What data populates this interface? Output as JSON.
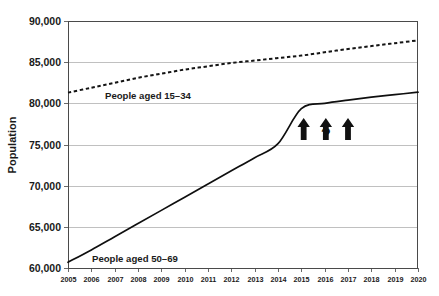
{
  "chart_data": {
    "type": "line",
    "title": "",
    "xlabel": "",
    "ylabel": "Population",
    "xlim": [
      2005,
      2020
    ],
    "ylim": [
      60000,
      90000
    ],
    "grid": true,
    "legend_position": "inline-annotation",
    "x": [
      2005,
      2006,
      2007,
      2008,
      2009,
      2010,
      2011,
      2012,
      2013,
      2014,
      2015,
      2016,
      2017,
      2018,
      2019,
      2020
    ],
    "x_tick_labels": [
      "2005",
      "2006",
      "2007",
      "2008",
      "2009",
      "2010",
      "2011",
      "2012",
      "2013",
      "2014",
      "2015",
      "2016",
      "2017",
      "2018",
      "2019",
      "2020"
    ],
    "y_tick_labels": [
      "60,000",
      "65,000",
      "70,000",
      "75,000",
      "80,000",
      "85,000",
      "90,000"
    ],
    "y_ticks": [
      60000,
      65000,
      70000,
      75000,
      80000,
      85000,
      90000
    ],
    "series": [
      {
        "name": "People aged 15–34",
        "style": "dashed",
        "values": [
          81300,
          81900,
          82500,
          83100,
          83600,
          84100,
          84500,
          84900,
          85200,
          85500,
          85800,
          86200,
          86600,
          86950,
          87300,
          87650
        ]
      },
      {
        "name": "People aged 50–69",
        "style": "solid",
        "values": [
          60700,
          62200,
          63800,
          65400,
          67000,
          68600,
          70200,
          71800,
          73400,
          75100,
          79350,
          80000,
          80400,
          80750,
          81050,
          81350
        ]
      }
    ],
    "annotations": [
      {
        "type": "arrow-up",
        "label": "arrow-up-1",
        "x": 2015.1
      },
      {
        "type": "arrow-up",
        "label": "arrow-up-2",
        "x": 2016.05
      },
      {
        "type": "arrow-up",
        "label": "arrow-up-3",
        "x": 2017.0
      },
      {
        "type": "text",
        "label": "question-mark",
        "text": "?",
        "x": 2016.05,
        "y": 75600
      }
    ]
  },
  "series_labels": {
    "upper": "People aged 15–34",
    "lower": "People aged 50–69"
  },
  "axis": {
    "y_title": "Population"
  },
  "annotation_text": {
    "question_mark": "?"
  },
  "colors": {
    "line": "#111111",
    "grid": "#b9b9b9",
    "axis": "#4a4a4a",
    "background": "#ffffff"
  }
}
